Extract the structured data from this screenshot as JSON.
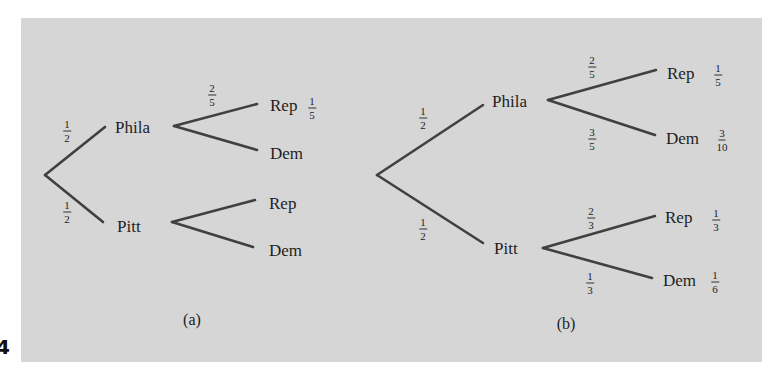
{
  "page_marker": "4",
  "diagram_a": {
    "caption": "(a)",
    "root_edges": [
      {
        "to": "Phila",
        "prob": {
          "num": "1",
          "den": "2"
        }
      },
      {
        "to": "Pitt",
        "prob": {
          "num": "1",
          "den": "2"
        }
      }
    ],
    "nodes": {
      "phila": "Phila",
      "pitt": "Pitt",
      "phila_rep": "Rep",
      "phila_dem": "Dem",
      "pitt_rep": "Rep",
      "pitt_dem": "Dem"
    },
    "phila_rep_edge_prob": {
      "num": "2",
      "den": "5"
    },
    "phila_rep_leaf_prob": {
      "num": "1",
      "den": "5"
    }
  },
  "diagram_b": {
    "caption": "(b)",
    "root_edges": [
      {
        "to": "Phila",
        "prob": {
          "num": "1",
          "den": "2"
        }
      },
      {
        "to": "Pitt",
        "prob": {
          "num": "1",
          "den": "2"
        }
      }
    ],
    "nodes": {
      "phila": "Phila",
      "pitt": "Pitt",
      "phila_rep": "Rep",
      "phila_dem": "Dem",
      "pitt_rep": "Rep",
      "pitt_dem": "Dem"
    },
    "edge_probs": {
      "phila_rep": {
        "num": "2",
        "den": "5"
      },
      "phila_dem": {
        "num": "3",
        "den": "5"
      },
      "pitt_rep": {
        "num": "2",
        "den": "3"
      },
      "pitt_dem": {
        "num": "1",
        "den": "3"
      }
    },
    "leaf_probs": {
      "phila_rep": {
        "num": "1",
        "den": "5"
      },
      "phila_dem": {
        "num": "3",
        "den": "10"
      },
      "pitt_rep": {
        "num": "1",
        "den": "3"
      },
      "pitt_dem": {
        "num": "1",
        "den": "6"
      }
    }
  },
  "colors": {
    "panel_background": "#d6d6d6",
    "edge": "#404040",
    "text": "#1e1e1e"
  }
}
